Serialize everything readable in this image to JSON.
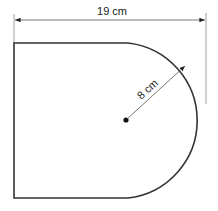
{
  "diagram": {
    "shape": "rectangle with semicircular end",
    "width_label": "19 cm",
    "radius_label": "8 cm",
    "width_cm": 19,
    "radius_cm": 8,
    "colors": {
      "outline": "#333333",
      "dimension": "#555555",
      "background": "#ffffff"
    }
  }
}
